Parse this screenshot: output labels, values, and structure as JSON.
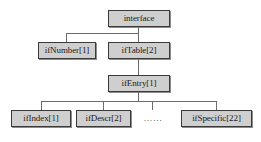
{
  "diagram": {
    "colors": {
      "node_fill": "#cfcfcf",
      "node_border": "#3a3a3a",
      "connector": "#6b6b6b",
      "text": "#1a1a1a",
      "background": "#ffffff"
    },
    "nodes": {
      "root": {
        "label": "interface"
      },
      "if_number": {
        "label": "ifNumber[1]"
      },
      "if_table": {
        "label": "ifTable[2]"
      },
      "if_entry": {
        "label": "ifEntry[1]"
      },
      "if_index": {
        "label": "ifIndex[1]"
      },
      "if_descr": {
        "label": "ifDescr[2]"
      },
      "if_specific": {
        "label": "ifSpecific[22]"
      }
    },
    "ellipsis": {
      "label": "……"
    }
  }
}
